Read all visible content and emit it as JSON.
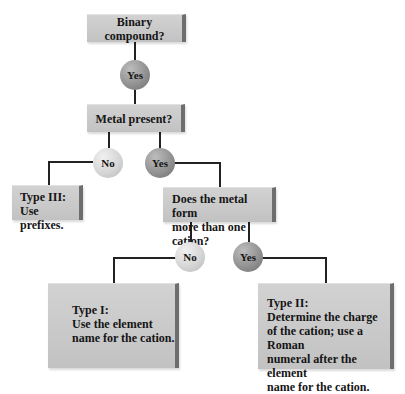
{
  "nodes": {
    "binary": "Binary compound?",
    "yes1": "Yes",
    "metal": "Metal present?",
    "no1": "No",
    "yes2": "Yes",
    "type3": "Type III:\nUse prefixes.",
    "cation": "Does the metal form\nmore than one cation?",
    "no2": "No",
    "yes3": "Yes",
    "type1": "Type I:\nUse the element\nname for the cation.",
    "type2": "Type II:\nDetermine the charge\nof the cation; use a Roman\nnumeral after the element\nname for the cation."
  },
  "colors": {
    "box": "#c4c4c4",
    "box_edge": "#6e6e6e",
    "no_circle": "#d6d6d6",
    "yes_circle": "#929292",
    "line": "#222222"
  }
}
